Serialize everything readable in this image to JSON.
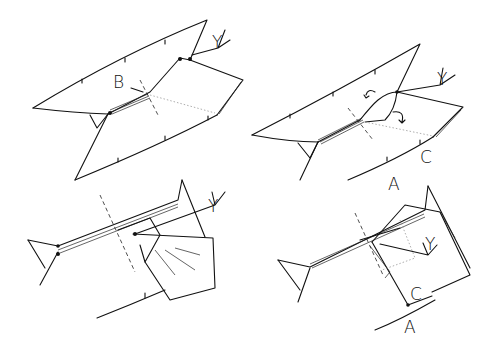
{
  "diagram": {
    "type": "origami folding instructions",
    "steps": [
      {
        "position": "top-left",
        "labels": [
          "Y",
          "B"
        ]
      },
      {
        "position": "top-right",
        "labels": [
          "Y",
          "A",
          "C"
        ]
      },
      {
        "position": "bottom-left",
        "labels": [
          "Y"
        ]
      },
      {
        "position": "bottom-right",
        "labels": [
          "Y",
          "C",
          "A"
        ]
      }
    ]
  },
  "labels": {
    "s1_y": "Y",
    "s1_b": "B",
    "s2_y": "Y",
    "s2_a": "A",
    "s2_c": "C",
    "s3_y": "Y",
    "s4_y": "Y",
    "s4_c": "C",
    "s4_a": "A"
  }
}
